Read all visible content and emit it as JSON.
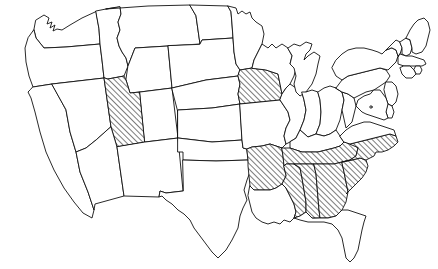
{
  "map": {
    "title": "Map of the contiguous United States",
    "region": "Contiguous United States (Lower 48)",
    "projection_note": "Albers-style conic projection outline",
    "background_color": "#ffffff",
    "border_color": "#111111",
    "highlight_fill_description": "black diagonal hatch lines rising left-to-right",
    "unhighlighted_fill_color": "#ffffff",
    "highlight_count": 9,
    "total_states_shown": 49,
    "legend_present": false,
    "labels_present": false,
    "highlighted_states": [
      "Utah",
      "Iowa",
      "Arkansas",
      "Tennessee",
      "North Carolina",
      "South Carolina",
      "Mississippi",
      "Alabama",
      "Georgia"
    ],
    "states": [
      {
        "id": "WA",
        "name": "Washington",
        "highlighted": false
      },
      {
        "id": "OR",
        "name": "Oregon",
        "highlighted": false
      },
      {
        "id": "CA",
        "name": "California",
        "highlighted": false
      },
      {
        "id": "NV",
        "name": "Nevada",
        "highlighted": false
      },
      {
        "id": "ID",
        "name": "Idaho",
        "highlighted": false
      },
      {
        "id": "MT",
        "name": "Montana",
        "highlighted": false
      },
      {
        "id": "WY",
        "name": "Wyoming",
        "highlighted": false
      },
      {
        "id": "UT",
        "name": "Utah",
        "highlighted": true
      },
      {
        "id": "AZ",
        "name": "Arizona",
        "highlighted": false
      },
      {
        "id": "CO",
        "name": "Colorado",
        "highlighted": false
      },
      {
        "id": "NM",
        "name": "New Mexico",
        "highlighted": false
      },
      {
        "id": "ND",
        "name": "North Dakota",
        "highlighted": false
      },
      {
        "id": "SD",
        "name": "South Dakota",
        "highlighted": false
      },
      {
        "id": "NE",
        "name": "Nebraska",
        "highlighted": false
      },
      {
        "id": "KS",
        "name": "Kansas",
        "highlighted": false
      },
      {
        "id": "OK",
        "name": "Oklahoma",
        "highlighted": false
      },
      {
        "id": "TX",
        "name": "Texas",
        "highlighted": false
      },
      {
        "id": "MN",
        "name": "Minnesota",
        "highlighted": false
      },
      {
        "id": "IA",
        "name": "Iowa",
        "highlighted": true
      },
      {
        "id": "MO",
        "name": "Missouri",
        "highlighted": false
      },
      {
        "id": "AR",
        "name": "Arkansas",
        "highlighted": true
      },
      {
        "id": "LA",
        "name": "Louisiana",
        "highlighted": false
      },
      {
        "id": "WI",
        "name": "Wisconsin",
        "highlighted": false
      },
      {
        "id": "IL",
        "name": "Illinois",
        "highlighted": false
      },
      {
        "id": "MI",
        "name": "Michigan",
        "highlighted": false
      },
      {
        "id": "IN",
        "name": "Indiana",
        "highlighted": false
      },
      {
        "id": "OH",
        "name": "Ohio",
        "highlighted": false
      },
      {
        "id": "KY",
        "name": "Kentucky",
        "highlighted": false
      },
      {
        "id": "TN",
        "name": "Tennessee",
        "highlighted": true
      },
      {
        "id": "MS",
        "name": "Mississippi",
        "highlighted": true
      },
      {
        "id": "AL",
        "name": "Alabama",
        "highlighted": true
      },
      {
        "id": "GA",
        "name": "Georgia",
        "highlighted": true
      },
      {
        "id": "FL",
        "name": "Florida",
        "highlighted": false
      },
      {
        "id": "SC",
        "name": "South Carolina",
        "highlighted": true
      },
      {
        "id": "NC",
        "name": "North Carolina",
        "highlighted": true
      },
      {
        "id": "VA",
        "name": "Virginia",
        "highlighted": false
      },
      {
        "id": "WV",
        "name": "West Virginia",
        "highlighted": false
      },
      {
        "id": "PA",
        "name": "Pennsylvania",
        "highlighted": false
      },
      {
        "id": "NY",
        "name": "New York",
        "highlighted": false
      },
      {
        "id": "VT",
        "name": "Vermont",
        "highlighted": false
      },
      {
        "id": "NH",
        "name": "New Hampshire",
        "highlighted": false
      },
      {
        "id": "ME",
        "name": "Maine",
        "highlighted": false
      },
      {
        "id": "MA",
        "name": "Massachusetts",
        "highlighted": false
      },
      {
        "id": "RI",
        "name": "Rhode Island",
        "highlighted": false
      },
      {
        "id": "CT",
        "name": "Connecticut",
        "highlighted": false
      },
      {
        "id": "NJ",
        "name": "New Jersey",
        "highlighted": false
      },
      {
        "id": "DE",
        "name": "Delaware",
        "highlighted": false
      },
      {
        "id": "MD",
        "name": "Maryland",
        "highlighted": false
      },
      {
        "id": "DC",
        "name": "District of Columbia",
        "highlighted": false
      }
    ]
  }
}
